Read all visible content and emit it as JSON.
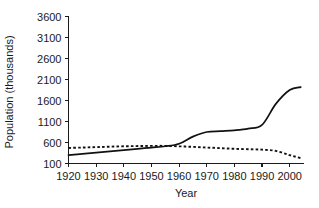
{
  "chart_data": {
    "type": "line",
    "title": "",
    "xlabel": "Year",
    "ylabel": "Population (thousands)",
    "xlim": [
      1920,
      2005
    ],
    "ylim": [
      100,
      3600
    ],
    "grid": false,
    "legend": "none",
    "x_ticks": [
      "1920",
      "1930",
      "1940",
      "1950",
      "1960",
      "1970",
      "1980",
      "1990",
      "2000"
    ],
    "y_ticks": [
      "100",
      "600",
      "1100",
      "1600",
      "2100",
      "2600",
      "3100",
      "3600"
    ],
    "x": [
      1920,
      1925,
      1930,
      1935,
      1940,
      1945,
      1950,
      1955,
      1960,
      1965,
      1970,
      1975,
      1980,
      1985,
      1990,
      1995,
      2000,
      2004
    ],
    "series": [
      {
        "name": "solid-line-series",
        "style": "solid",
        "color": "#111111",
        "values": [
          300,
          330,
          360,
          390,
          420,
          450,
          480,
          510,
          570,
          740,
          850,
          870,
          890,
          930,
          1020,
          1520,
          1850,
          1920
        ]
      },
      {
        "name": "dotted-line-series",
        "style": "dotted",
        "color": "#111111",
        "values": [
          470,
          480,
          490,
          500,
          510,
          515,
          520,
          520,
          510,
          495,
          480,
          465,
          450,
          440,
          430,
          400,
          300,
          230
        ]
      }
    ]
  },
  "axes": {
    "x_axis_name": "Year",
    "y_axis_name": "Population (thousands)"
  }
}
